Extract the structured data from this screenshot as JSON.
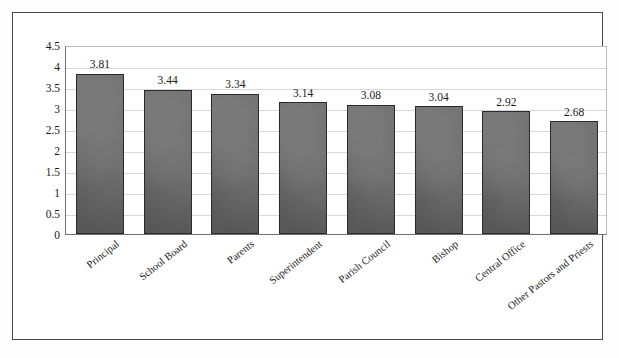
{
  "chart_data": {
    "type": "bar",
    "title": "",
    "subtitle": "",
    "xlabel": "",
    "ylabel": "",
    "ylim": [
      0,
      4.5
    ],
    "grid": true,
    "legend": "none",
    "orientation": "vertical",
    "categories": [
      "Principal",
      "School Board",
      "Parents",
      "Superintendent",
      "Parish Council",
      "Bishop",
      "Central Office",
      "Other Pastors and Priests"
    ],
    "values": [
      3.81,
      3.44,
      3.34,
      3.14,
      3.08,
      3.04,
      2.92,
      2.68
    ],
    "value_labels": [
      "3.81",
      "3.44",
      "3.34",
      "3.14",
      "3.08",
      "3.04",
      "2.92",
      "2.68"
    ],
    "ytick_labels": [
      "0",
      "0.5",
      "1",
      "1.5",
      "2",
      "2.5",
      "3",
      "3.5",
      "4",
      "4.5"
    ],
    "ytick_values": [
      0,
      0.5,
      1,
      1.5,
      2,
      2.5,
      3,
      3.5,
      4,
      4.5
    ],
    "series_color": "#646464",
    "bar_border_color": "#2a2a2a",
    "gridline_color": "#d8d8d8",
    "axis_color": "#6f6f6f",
    "frame_color": "#4a4a4a",
    "background_color": "#ffffff",
    "text_color": "#1a1a1a"
  }
}
